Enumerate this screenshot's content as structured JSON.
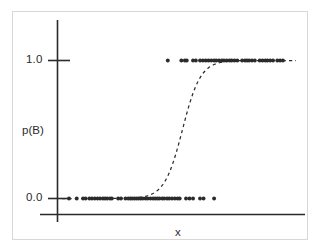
{
  "figure": {
    "background_color": "#ffffff",
    "frame_color": "#d8d8d8",
    "ink_color": "#2b2b2b"
  },
  "axes": {
    "y_axis_label": "p(B)",
    "x_axis_label": "x",
    "y_tick_labels": [
      "1.0",
      "0.0"
    ],
    "x_tick_labels": []
  },
  "chart_data": {
    "type": "scatter",
    "title": "",
    "subtitle": "",
    "xlabel": "x",
    "ylabel": "p(B)",
    "xlim": [
      0,
      1
    ],
    "ylim": [
      0.0,
      1.0
    ],
    "yticks": [
      0.0,
      1.0
    ],
    "ytick_labels": [
      "0.0",
      "1.0"
    ],
    "xticks": [],
    "grid": false,
    "legend": null,
    "legend_position": "none",
    "annotations": [],
    "series": [
      {
        "name": "observations",
        "type": "scatter",
        "marker": "circle",
        "marker_size": 3,
        "color": "#2b2b2b",
        "points": [
          {
            "x": 0.03,
            "y": 0.0
          },
          {
            "x": 0.063,
            "y": 0.0
          },
          {
            "x": 0.09,
            "y": 0.0
          },
          {
            "x": 0.101,
            "y": 0.0
          },
          {
            "x": 0.117,
            "y": 0.0
          },
          {
            "x": 0.128,
            "y": 0.0
          },
          {
            "x": 0.14,
            "y": 0.0
          },
          {
            "x": 0.152,
            "y": 0.0
          },
          {
            "x": 0.163,
            "y": 0.0
          },
          {
            "x": 0.175,
            "y": 0.0
          },
          {
            "x": 0.184,
            "y": 0.0
          },
          {
            "x": 0.193,
            "y": 0.0
          },
          {
            "x": 0.205,
            "y": 0.0
          },
          {
            "x": 0.213,
            "y": 0.0
          },
          {
            "x": 0.24,
            "y": 0.0
          },
          {
            "x": 0.252,
            "y": 0.0
          },
          {
            "x": 0.271,
            "y": 0.0
          },
          {
            "x": 0.283,
            "y": 0.0
          },
          {
            "x": 0.292,
            "y": 0.0
          },
          {
            "x": 0.3,
            "y": 0.0
          },
          {
            "x": 0.309,
            "y": 0.0
          },
          {
            "x": 0.318,
            "y": 0.0
          },
          {
            "x": 0.327,
            "y": 0.0
          },
          {
            "x": 0.336,
            "y": 0.0
          },
          {
            "x": 0.345,
            "y": 0.0
          },
          {
            "x": 0.357,
            "y": 0.0
          },
          {
            "x": 0.366,
            "y": 0.0
          },
          {
            "x": 0.378,
            "y": 0.0
          },
          {
            "x": 0.389,
            "y": 0.0
          },
          {
            "x": 0.398,
            "y": 0.0
          },
          {
            "x": 0.407,
            "y": 0.0
          },
          {
            "x": 0.416,
            "y": 0.0
          },
          {
            "x": 0.428,
            "y": 0.0
          },
          {
            "x": 0.437,
            "y": 0.0
          },
          {
            "x": 0.449,
            "y": 0.0
          },
          {
            "x": 0.458,
            "y": 0.0
          },
          {
            "x": 0.47,
            "y": 0.0
          },
          {
            "x": 0.482,
            "y": 0.0
          },
          {
            "x": 0.494,
            "y": 0.0
          },
          {
            "x": 0.503,
            "y": 0.0
          },
          {
            "x": 0.53,
            "y": 0.0
          },
          {
            "x": 0.545,
            "y": 0.0
          },
          {
            "x": 0.56,
            "y": 0.0
          },
          {
            "x": 0.59,
            "y": 0.0
          },
          {
            "x": 0.605,
            "y": 0.0
          },
          {
            "x": 0.65,
            "y": 0.0
          },
          {
            "x": 0.452,
            "y": 1.0
          },
          {
            "x": 0.51,
            "y": 1.0
          },
          {
            "x": 0.525,
            "y": 1.0
          },
          {
            "x": 0.533,
            "y": 1.0
          },
          {
            "x": 0.56,
            "y": 1.0
          },
          {
            "x": 0.572,
            "y": 1.0
          },
          {
            "x": 0.59,
            "y": 1.0
          },
          {
            "x": 0.602,
            "y": 1.0
          },
          {
            "x": 0.614,
            "y": 1.0
          },
          {
            "x": 0.626,
            "y": 1.0
          },
          {
            "x": 0.638,
            "y": 1.0
          },
          {
            "x": 0.65,
            "y": 1.0
          },
          {
            "x": 0.659,
            "y": 1.0
          },
          {
            "x": 0.671,
            "y": 1.0
          },
          {
            "x": 0.683,
            "y": 1.0
          },
          {
            "x": 0.692,
            "y": 1.0
          },
          {
            "x": 0.704,
            "y": 1.0
          },
          {
            "x": 0.716,
            "y": 1.0
          },
          {
            "x": 0.725,
            "y": 1.0
          },
          {
            "x": 0.737,
            "y": 1.0
          },
          {
            "x": 0.749,
            "y": 1.0
          },
          {
            "x": 0.77,
            "y": 1.0
          },
          {
            "x": 0.782,
            "y": 1.0
          },
          {
            "x": 0.791,
            "y": 1.0
          },
          {
            "x": 0.8,
            "y": 1.0
          },
          {
            "x": 0.812,
            "y": 1.0
          },
          {
            "x": 0.824,
            "y": 1.0
          },
          {
            "x": 0.845,
            "y": 1.0
          },
          {
            "x": 0.857,
            "y": 1.0
          },
          {
            "x": 0.869,
            "y": 1.0
          },
          {
            "x": 0.878,
            "y": 1.0
          },
          {
            "x": 0.89,
            "y": 1.0
          },
          {
            "x": 0.902,
            "y": 1.0
          },
          {
            "x": 0.92,
            "y": 1.0
          },
          {
            "x": 0.932,
            "y": 1.0
          },
          {
            "x": 0.944,
            "y": 1.0
          }
        ]
      },
      {
        "name": "fitted-logistic-curve",
        "type": "line",
        "style": "dashed",
        "color": "#2b2b2b",
        "x0": 0.515,
        "steepness": 26,
        "points": [
          {
            "x": 0.02,
            "y": 0.001
          },
          {
            "x": 0.15,
            "y": 0.002
          },
          {
            "x": 0.3,
            "y": 0.004
          },
          {
            "x": 0.4,
            "y": 0.018
          },
          {
            "x": 0.44,
            "y": 0.049
          },
          {
            "x": 0.46,
            "y": 0.08
          },
          {
            "x": 0.475,
            "y": 0.12
          },
          {
            "x": 0.49,
            "y": 0.2
          },
          {
            "x": 0.5,
            "y": 0.3
          },
          {
            "x": 0.51,
            "y": 0.44
          },
          {
            "x": 0.52,
            "y": 0.57
          },
          {
            "x": 0.53,
            "y": 0.7
          },
          {
            "x": 0.545,
            "y": 0.84
          },
          {
            "x": 0.56,
            "y": 0.92
          },
          {
            "x": 0.58,
            "y": 0.965
          },
          {
            "x": 0.61,
            "y": 0.988
          },
          {
            "x": 0.7,
            "y": 0.996
          },
          {
            "x": 0.85,
            "y": 0.998
          },
          {
            "x": 0.99,
            "y": 0.999
          }
        ]
      }
    ]
  }
}
